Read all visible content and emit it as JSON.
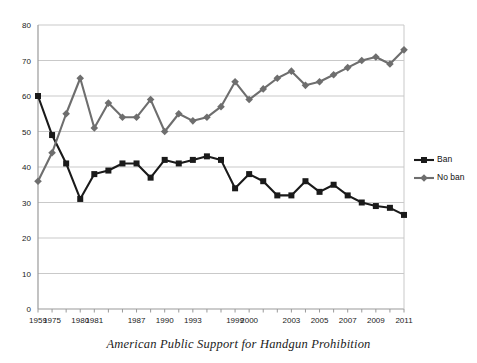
{
  "caption": "American Public Support for Handgun Prohibition",
  "legend": {
    "position": "right",
    "items": [
      {
        "label": "Ban",
        "color": "#1a1a1a",
        "marker": "square"
      },
      {
        "label": "No ban",
        "color": "#6e6e6e",
        "marker": "diamond"
      }
    ]
  },
  "chart_data": {
    "type": "line",
    "title": "",
    "subtitle": "",
    "xlabel": "",
    "ylabel": "",
    "ylim": [
      0,
      80
    ],
    "yticks": [
      0,
      10,
      20,
      30,
      40,
      50,
      60,
      70,
      80
    ],
    "grid": true,
    "grid_axis": "y",
    "legend_position": "right",
    "x": [
      "1959",
      "1975",
      "1976",
      "1980",
      "1981",
      "1982",
      "1983",
      "1987",
      "1988",
      "1990",
      "1991",
      "1993",
      "1995",
      "1996",
      "1999",
      "2000",
      "2001",
      "2002",
      "2003",
      "2004",
      "2005",
      "2006",
      "2007",
      "2008",
      "2009",
      "2010",
      "2011"
    ],
    "xtick_labels": [
      "1959",
      "1975",
      "",
      "1980",
      "1981",
      "",
      "",
      "1987",
      "",
      "1990",
      "",
      "1993",
      "",
      "",
      "1999",
      "2000",
      "",
      "",
      "2003",
      "",
      "2005",
      "",
      "2007",
      "",
      "2009",
      "",
      "2011"
    ],
    "series": [
      {
        "name": "Ban",
        "color": "#1a1a1a",
        "marker": "square",
        "values": [
          60,
          49,
          41,
          31,
          38,
          39,
          41,
          41,
          37,
          42,
          41,
          42,
          43,
          42,
          34,
          38,
          36,
          32,
          32,
          36,
          33,
          35,
          32,
          30,
          29,
          28.5,
          26.5
        ]
      },
      {
        "name": "No ban",
        "color": "#6e6e6e",
        "marker": "diamond",
        "values": [
          36,
          44,
          55,
          65,
          51,
          58,
          54,
          54,
          59,
          50,
          55,
          53,
          54,
          57,
          64,
          59,
          62,
          65,
          67,
          63,
          64,
          66,
          68,
          70,
          71,
          69,
          73
        ]
      }
    ]
  },
  "axes": {
    "x_axis_name": "year-axis",
    "y_axis_name": "percent-axis"
  }
}
